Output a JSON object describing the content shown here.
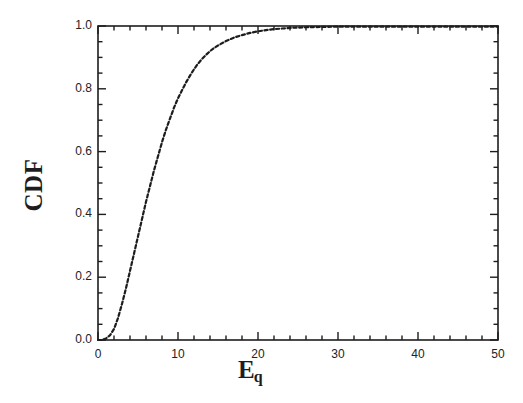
{
  "figure": {
    "background_color": "#ffffff",
    "ink_color": "#1d1d1d",
    "ylabel": "CDF",
    "xlabel_base": "E",
    "xlabel_sub": "q"
  },
  "axes": {
    "x_tick_labels": [
      "0",
      "10",
      "20",
      "30",
      "40",
      "50"
    ],
    "y_tick_labels": [
      "0.0",
      "0.2",
      "0.4",
      "0.6",
      "0.8",
      "1.0"
    ],
    "x_tick_values": [
      0,
      10,
      20,
      30,
      40,
      50
    ],
    "y_tick_values": [
      0.0,
      0.2,
      0.4,
      0.6,
      0.8,
      1.0
    ],
    "x_minor_step": 2,
    "y_minor_step": 0.05,
    "frame": "box"
  },
  "chart_data": {
    "type": "line",
    "title": "",
    "subtitle": "",
    "xlabel": "Eq",
    "ylabel": "CDF",
    "xlim": [
      0,
      50
    ],
    "ylim": [
      0.0,
      1.0
    ],
    "grid": false,
    "legend": null,
    "legend_position": "none",
    "line_style": "dashed",
    "line_color": "#1d1d1d",
    "line_width": 2,
    "annotations": [],
    "series": [
      {
        "name": "CDF of Eq",
        "x": [
          0,
          0.5,
          1,
          1.5,
          2,
          2.5,
          3,
          3.5,
          4,
          4.5,
          5,
          5.5,
          6,
          6.5,
          7,
          7.5,
          8,
          8.5,
          9,
          9.5,
          10,
          10.5,
          11,
          11.5,
          12,
          12.5,
          13,
          13.5,
          14,
          14.5,
          15,
          16,
          17,
          18,
          19,
          20,
          21,
          22,
          23,
          24,
          25,
          26,
          28,
          30,
          32,
          35,
          38,
          40,
          43,
          46,
          50
        ],
        "values": [
          0.0,
          0.0,
          0.005,
          0.015,
          0.035,
          0.07,
          0.115,
          0.165,
          0.22,
          0.275,
          0.33,
          0.385,
          0.44,
          0.49,
          0.54,
          0.585,
          0.63,
          0.67,
          0.705,
          0.74,
          0.77,
          0.795,
          0.82,
          0.842,
          0.862,
          0.88,
          0.895,
          0.908,
          0.92,
          0.93,
          0.938,
          0.952,
          0.963,
          0.971,
          0.978,
          0.983,
          0.987,
          0.99,
          0.992,
          0.994,
          0.995,
          0.996,
          0.997,
          0.998,
          0.998,
          0.998,
          0.998,
          0.998,
          0.998,
          0.998,
          0.998
        ]
      }
    ],
    "description_points": [
      {
        "x": 1,
        "y": 0.005
      },
      {
        "x": 5,
        "y": 0.33
      },
      {
        "x": 10,
        "y": 0.77
      },
      {
        "x": 15,
        "y": 0.938
      },
      {
        "x": 20,
        "y": 0.983
      },
      {
        "x": 25,
        "y": 0.995
      },
      {
        "x": 50,
        "y": 0.998
      }
    ]
  }
}
